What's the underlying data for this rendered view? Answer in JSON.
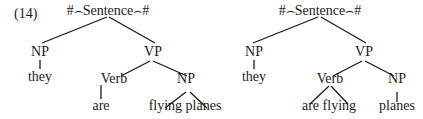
{
  "example_number": "(14)",
  "trees": [
    {
      "root": "#⌢Sentence⌢#",
      "np": "NP",
      "vp": "VP",
      "np_leaf": "they",
      "verb": "Verb",
      "verb_leaf": "are",
      "obj_np": "NP",
      "obj_leaf": "flying planes"
    },
    {
      "root": "#⌢Sentence⌢#",
      "np": "NP",
      "vp": "VP",
      "np_leaf": "they",
      "verb": "Verb",
      "verb_leaf": "are flying",
      "obj_np": "NP",
      "obj_leaf": "planes"
    }
  ]
}
